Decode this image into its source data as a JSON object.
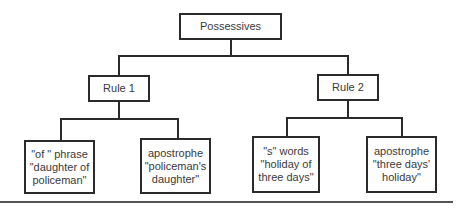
{
  "diagram": {
    "type": "tree",
    "root": {
      "label": "Possessives"
    },
    "rules": [
      {
        "label": "Rule 1",
        "children": [
          {
            "lines": [
              "\"of \" phrase",
              "\"daughter of",
              "policeman\""
            ]
          },
          {
            "lines": [
              "apostrophe",
              "\"policeman's",
              "daughter\""
            ]
          }
        ]
      },
      {
        "label": "Rule 2",
        "children": [
          {
            "lines": [
              "\"s\" words",
              "\"holiday of",
              "three days\""
            ]
          },
          {
            "lines": [
              "apostrophe",
              "\"three days'",
              "holiday\""
            ]
          }
        ]
      }
    ],
    "colors": {
      "line": "#2b2b2b",
      "text": "#3a3a3a",
      "background": "#ffffff"
    }
  }
}
